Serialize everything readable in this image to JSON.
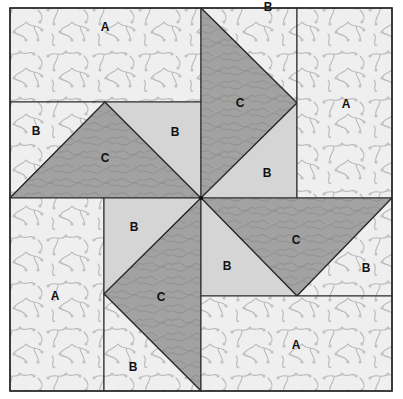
{
  "diagram": {
    "type": "quilt-block",
    "colors": {
      "print_light": "#efefef",
      "vine": "#b4b4b4",
      "solid_light": "#d5d5d5",
      "dark": "#a2a2a2",
      "dark_swirl": "#8a8a8a",
      "outline": "#2a2a2a"
    },
    "pieces": [
      {
        "id": "tl-a",
        "label": "A",
        "fabric": "print",
        "points": "10,8 201,8 201,102 10,102",
        "lx": 105,
        "ly": 31
      },
      {
        "id": "tl-b1",
        "label": "B",
        "fabric": "print",
        "points": "10,102 105,102 10,198",
        "lx": 36,
        "ly": 135
      },
      {
        "id": "tl-c",
        "label": "C",
        "fabric": "dark",
        "points": "105,102 201,198 10,198",
        "lx": 105,
        "ly": 162
      },
      {
        "id": "tl-b2",
        "label": "B",
        "fabric": "solid",
        "points": "105,102 201,102 201,198",
        "lx": 175,
        "ly": 136
      },
      {
        "id": "tr-b1",
        "label": "B",
        "fabric": "print",
        "points": "201,8 297,8 297,103",
        "lx": 268,
        "ly": 11
      },
      {
        "id": "tr-c",
        "label": "C",
        "fabric": "dark",
        "points": "201,8 297,103 201,198",
        "lx": 240,
        "ly": 107
      },
      {
        "id": "tr-b2",
        "label": "B",
        "fabric": "solid",
        "points": "297,103 297,198 201,198",
        "lx": 267,
        "ly": 177
      },
      {
        "id": "tr-a",
        "label": "A",
        "fabric": "print",
        "points": "297,8 392,8 392,198 297,198",
        "lx": 346,
        "ly": 108
      },
      {
        "id": "bl-a",
        "label": "A",
        "fabric": "print",
        "points": "10,198 104,198 104,391 10,391",
        "lx": 55,
        "ly": 300
      },
      {
        "id": "bl-b1",
        "label": "B",
        "fabric": "solid",
        "points": "104,198 201,198 104,294",
        "lx": 134,
        "ly": 231
      },
      {
        "id": "bl-c",
        "label": "C",
        "fabric": "dark",
        "points": "201,198 201,391 104,294",
        "lx": 161,
        "ly": 301
      },
      {
        "id": "bl-b2",
        "label": "B",
        "fabric": "print",
        "points": "104,294 201,391 104,391",
        "lx": 133,
        "ly": 371
      },
      {
        "id": "br-c",
        "label": "C",
        "fabric": "dark",
        "points": "201,198 392,198 297,296",
        "lx": 296,
        "ly": 244
      },
      {
        "id": "br-b1",
        "label": "B",
        "fabric": "solid",
        "points": "201,198 297,296 201,296",
        "lx": 227,
        "ly": 270
      },
      {
        "id": "br-b2",
        "label": "B",
        "fabric": "print",
        "points": "392,198 392,296 297,296",
        "lx": 366,
        "ly": 272
      },
      {
        "id": "br-a",
        "label": "A",
        "fabric": "print",
        "points": "201,296 392,296 392,391 201,391",
        "lx": 296,
        "ly": 349
      }
    ],
    "labels": {
      "tl_a": "A",
      "tl_b1": "B",
      "tl_c": "C",
      "tl_b2": "B",
      "tr_b1": "B",
      "tr_c": "C",
      "tr_b2": "B",
      "tr_a": "A",
      "bl_a": "A",
      "bl_b1": "B",
      "bl_c": "C",
      "bl_b2": "B",
      "br_c": "C",
      "br_b1": "B",
      "br_b2": "B",
      "br_a": "A"
    }
  }
}
